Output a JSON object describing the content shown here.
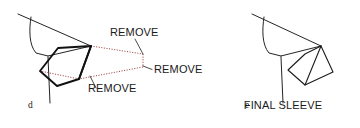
{
  "figure": {
    "background_color": "#ffffff",
    "line_color": "#1c1c1c",
    "remove_line_color": "#9c3b3b",
    "text_color": "#1a1a1a",
    "width": 360,
    "height": 128
  },
  "panels": [
    {
      "id": "panel-d",
      "letter": "d",
      "letter_x": 28,
      "letter_y": 108,
      "description": "Bodice with sleeve overlay and three REMOVE regions marked by dotted lines"
    },
    {
      "id": "panel-e",
      "letter": "e",
      "letter_x": 245,
      "letter_y": 108,
      "description": "Resulting bodice with the final sleeve shape"
    }
  ],
  "callouts": [
    {
      "id": "remove-top",
      "text": "REMOVE",
      "x": 110,
      "y": 36,
      "anchor": "start",
      "leader": "M 135 39 L 143 54"
    },
    {
      "id": "remove-right",
      "text": "REMOVE",
      "x": 154,
      "y": 73,
      "anchor": "start",
      "leader": "M 152 69.5 L 143 66"
    },
    {
      "id": "remove-bottom",
      "text": "REMOVE",
      "x": 88,
      "y": 92,
      "anchor": "start",
      "leader": "M 96 88 L 90 76"
    }
  ],
  "final_label": {
    "id": "final-sleeve-label",
    "text": "FINAL SLEEVE",
    "x": 283,
    "y": 109,
    "anchor": "middle"
  },
  "geometry": {
    "panel_d": {
      "shoulder_line": "M 18 14 L 91 46",
      "armhole_curve": "M 31 17 C 29 30, 29 45, 36 53 L 48 56",
      "body_underline": "M 48 56 L 91 46",
      "side_seam": "M 48 57 L 50 103",
      "bodice_front_edge": "M 91 46 L 56 86",
      "sleeve_cap_left": "M 56 86 L 40 71",
      "sleeve_outline": "M 91 46 L 79 79 L 57 86 L 40 71 L 58 48 L 91 46",
      "sleeve_inner_fold": "M 91 46 L 79 79",
      "sleeve_lower": "M 40 71 L 57 86 L 79 79",
      "sleeve_long_edge": "M 58 48 L 40 71",
      "dotted_upper": "M 91 46 L 143 54",
      "dotted_right": "M 143 54 L 143 67",
      "dotted_lower": "M 143 67 L 79 79",
      "dotted_mid": "M 79 79 L 40 71"
    },
    "panel_e": {
      "shoulder_line": "M 252 14 L 321 46",
      "armhole_curve": "M 264 17 C 262 30, 262 45, 269 53 L 281 56",
      "body_underline": "M 281 56 L 321 46",
      "side_seam": "M 281 57 L 283 103",
      "sleeve_outline": "M 321 46 L 333 72 L 305 85 L 288 70 L 305 54 L 321 46",
      "sleeve_seam": "M 321 46 L 305 85"
    }
  }
}
